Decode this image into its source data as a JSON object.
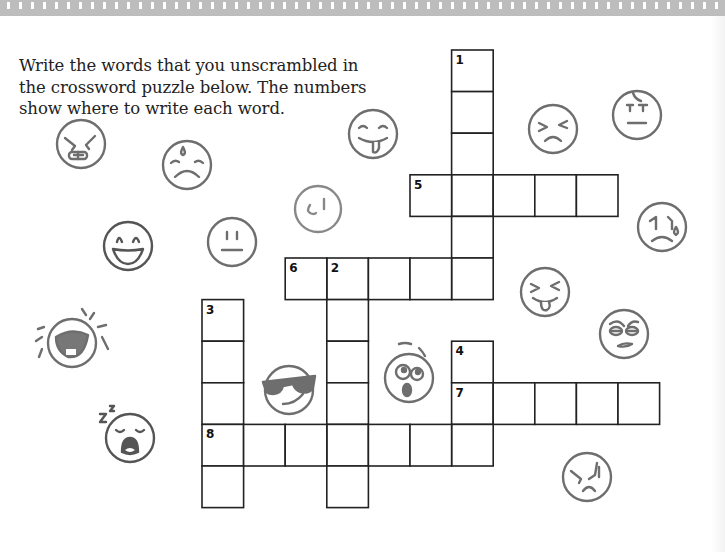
{
  "instructions": {
    "line1": "Write the words that you unscrambled in",
    "line2": "the crossword puzzle below. The numbers",
    "line3": "show where to write each word."
  },
  "crossword": {
    "cell_size_px": 41.6,
    "border_color": "#222222",
    "clue_numbers": [
      "1",
      "2",
      "3",
      "4",
      "5",
      "6",
      "7",
      "8"
    ],
    "entries": [
      {
        "number": "1",
        "direction": "down",
        "length": 6,
        "start": {
          "col": 6,
          "row": 0
        }
      },
      {
        "number": "2",
        "direction": "down",
        "length": 6,
        "start": {
          "col": 3,
          "row": 5
        }
      },
      {
        "number": "3",
        "direction": "down",
        "length": 5,
        "start": {
          "col": 0,
          "row": 6
        }
      },
      {
        "number": "4",
        "direction": "down",
        "length": 3,
        "start": {
          "col": 6,
          "row": 7
        }
      },
      {
        "number": "5",
        "direction": "across",
        "length": 5,
        "start": {
          "col": 5,
          "row": 3
        }
      },
      {
        "number": "6",
        "direction": "across",
        "length": 5,
        "start": {
          "col": 2,
          "row": 5
        }
      },
      {
        "number": "7",
        "direction": "across",
        "length": 5,
        "start": {
          "col": 6,
          "row": 8
        }
      },
      {
        "number": "8",
        "direction": "across",
        "length": 7,
        "start": {
          "col": 0,
          "row": 9
        }
      }
    ]
  },
  "decorations": {
    "face_color": "#6e6e6e",
    "faces": [
      "angry-grimace-face-icon",
      "sad-sweat-face-icon",
      "tongue-out-face-icon",
      "smirk-face-icon",
      "grinning-face-icon",
      "neutral-face-icon",
      "squinting-frown-face-icon",
      "annoyed-face-icon",
      "crying-face-icon",
      "squinting-tongue-face-icon",
      "eye-roll-face-icon",
      "laughing-tears-face-icon",
      "sunglasses-face-icon",
      "shocked-face-icon",
      "sleepy-yawn-face-icon",
      "furious-face-icon"
    ]
  }
}
